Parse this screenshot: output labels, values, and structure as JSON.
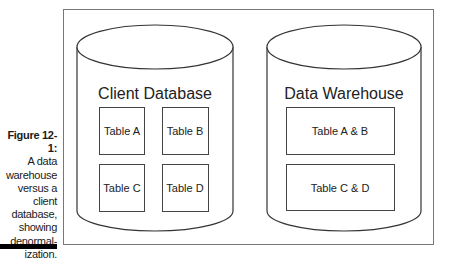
{
  "caption": {
    "figure_label": "Figure 12-1:",
    "lines": [
      "A data",
      "warehouse",
      "versus a",
      "client",
      "database,",
      "showing",
      "denormal-",
      "ization."
    ]
  },
  "diagram": {
    "client_db": {
      "title": "Client Database",
      "tables": [
        "Table A",
        "Table B",
        "Table C",
        "Table D"
      ]
    },
    "warehouse": {
      "title": "Data Warehouse",
      "tables": [
        "Table A & B",
        "Table C & D"
      ]
    }
  },
  "colors": {
    "stroke": "#333333",
    "frame": "#777777",
    "bar": "#000000"
  }
}
